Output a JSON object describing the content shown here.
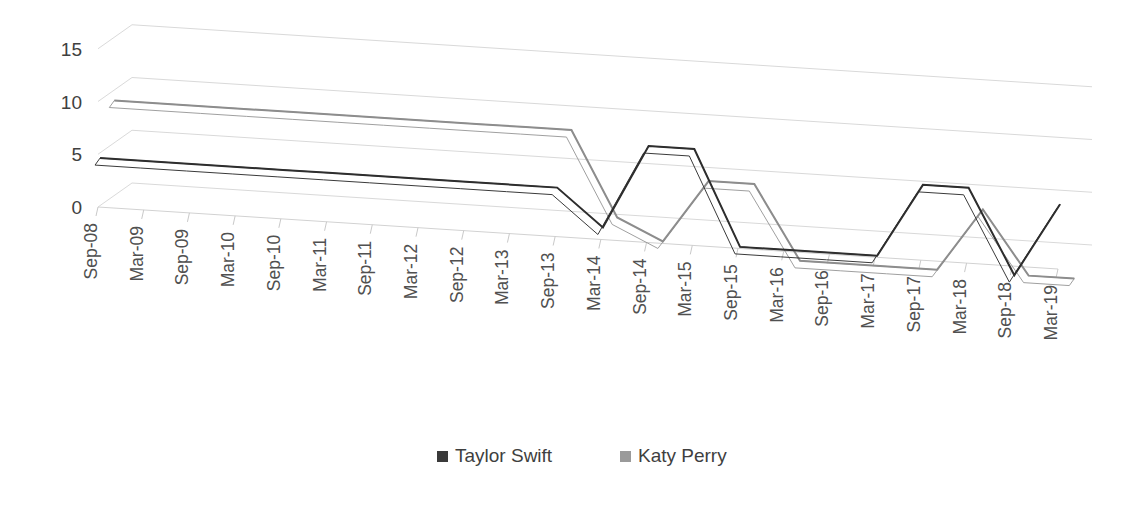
{
  "chart_data": {
    "type": "line",
    "title": "",
    "subtitle": "",
    "xlabel": "",
    "ylabel": "",
    "ylim": [
      0,
      15
    ],
    "yticks": [
      0,
      5,
      10,
      15
    ],
    "grid": true,
    "three_d": true,
    "legend_position": "bottom",
    "categories": [
      "Sep-08",
      "Mar-09",
      "Sep-09",
      "Mar-10",
      "Sep-10",
      "Mar-11",
      "Sep-11",
      "Mar-12",
      "Sep-12",
      "Mar-13",
      "Sep-13",
      "Mar-14",
      "Sep-14",
      "Mar-15",
      "Sep-15",
      "Mar-16",
      "Sep-16",
      "Mar-17",
      "Sep-17",
      "Mar-18",
      "Sep-18",
      "Mar-19"
    ],
    "series": [
      {
        "name": "Taylor Swift",
        "color": "#3a3a3a",
        "values": [
          4.5,
          4.5,
          4.5,
          4.5,
          4.5,
          4.5,
          4.5,
          4.5,
          4.5,
          4.5,
          4.5,
          1,
          9,
          9,
          0,
          0,
          0,
          0,
          7,
          7,
          -1,
          6
        ]
      },
      {
        "name": "Katy Perry",
        "color": "#9a9a9a",
        "values": [
          9,
          9,
          9,
          9,
          9,
          9,
          9,
          9,
          9,
          9,
          9,
          1,
          -1,
          5,
          5,
          -2,
          -2,
          -2,
          -2,
          4,
          -2,
          -2
        ]
      }
    ]
  },
  "legend": {
    "items": [
      {
        "label": "Taylor Swift",
        "marker": "square-marker",
        "color": "#3a3a3a"
      },
      {
        "label": "Katy Perry",
        "marker": "square-marker",
        "color": "#9a9a9a"
      }
    ]
  },
  "axes": {
    "y_tick_labels": [
      "15",
      "10",
      "5",
      "0"
    ],
    "x_tick_labels": [
      "Sep-08",
      "Mar-09",
      "Sep-09",
      "Mar-10",
      "Sep-10",
      "Mar-11",
      "Sep-11",
      "Mar-12",
      "Sep-12",
      "Mar-13",
      "Sep-13",
      "Mar-14",
      "Sep-14",
      "Mar-15",
      "Sep-15",
      "Mar-16",
      "Sep-16",
      "Mar-17",
      "Sep-17",
      "Mar-18",
      "Sep-18",
      "Mar-19"
    ]
  },
  "style": {
    "background": "#ffffff",
    "gridline_color": "#d9d9d9",
    "text_color": "#404040"
  }
}
